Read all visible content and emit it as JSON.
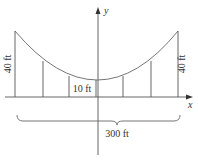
{
  "diagram": {
    "type": "suspension-bridge-parabola",
    "labels": {
      "left_height": "40 ft",
      "right_height": "40 ft",
      "center_height": "10 ft",
      "span": "300 ft",
      "x_axis": "x",
      "y_axis": "y"
    },
    "colors": {
      "line": "#555555",
      "text": "#333333",
      "background": "#ffffff"
    }
  }
}
